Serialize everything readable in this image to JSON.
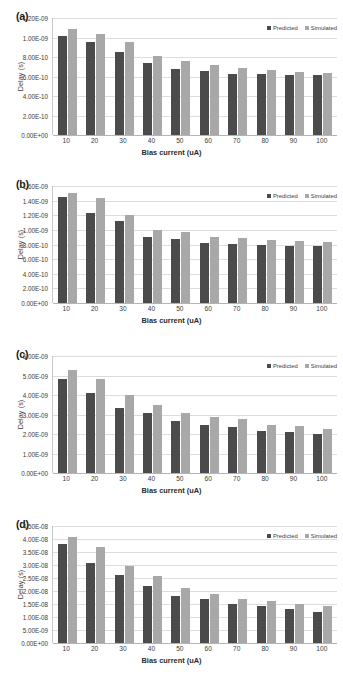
{
  "figure": {
    "panels": [
      {
        "label": "(a)",
        "legend": {
          "predicted": "Predicted",
          "simulated": "Simulated"
        },
        "chart_data": {
          "type": "bar",
          "title": "",
          "xlabel": "Bias current (uA)",
          "ylabel": "Delay (s)",
          "categories": [
            "10",
            "20",
            "30",
            "40",
            "50",
            "60",
            "70",
            "80",
            "90",
            "100"
          ],
          "yticklabels": [
            "0.00E+00",
            "2.00E-10",
            "4.00E-10",
            "6.00E-10",
            "8.00E-10",
            "1.00E-09",
            "1.20E-09"
          ],
          "ylim": [
            0,
            1.2e-09
          ],
          "ytickstep": 2e-10,
          "grid": true,
          "legend_position": "top-right",
          "series": [
            {
              "name": "Predicted",
              "color": "#4b4b4b",
              "values": [
                1.02e-09,
                9.55e-10,
                8.55e-10,
                7.35e-10,
                6.75e-10,
                6.55e-10,
                6.3e-10,
                6.25e-10,
                6.2e-10,
                6.2e-10
              ]
            },
            {
              "name": "Simulated",
              "color": "#a8a8a8",
              "values": [
                1.09e-09,
                1.035e-09,
                9.55e-10,
                8.1e-10,
                7.55e-10,
                7.15e-10,
                6.85e-10,
                6.65e-10,
                6.45e-10,
                6.4e-10
              ]
            }
          ]
        }
      },
      {
        "label": "(b)",
        "legend": {
          "predicted": "Predicted",
          "simulated": "Simulated"
        },
        "chart_data": {
          "type": "bar",
          "title": "",
          "xlabel": "Bias current (uA)",
          "ylabel": "Delay (s)",
          "categories": [
            "10",
            "20",
            "30",
            "40",
            "50",
            "60",
            "70",
            "80",
            "90",
            "100"
          ],
          "yticklabels": [
            "0.00E+00",
            "2.00E-10",
            "4.00E-10",
            "6.00E-10",
            "8.00E-10",
            "1.00E-09",
            "1.20E-09",
            "1.40E-09",
            "1.60E-09"
          ],
          "ylim": [
            0,
            1.6e-09
          ],
          "ytickstep": 2e-10,
          "grid": true,
          "legend_position": "top-right",
          "series": [
            {
              "name": "Predicted",
              "color": "#4b4b4b",
              "values": [
                1.455e-09,
                1.235e-09,
                1.115e-09,
                9e-10,
                8.8e-10,
                8.2e-10,
                8.1e-10,
                7.95e-10,
                7.85e-10,
                7.75e-10
              ]
            },
            {
              "name": "Simulated",
              "color": "#a8a8a8",
              "values": [
                1.51e-09,
                1.435e-09,
                1.205e-09,
                1.005e-09,
                9.75e-10,
                9.05e-10,
                8.9e-10,
                8.55e-10,
                8.45e-10,
                8.3e-10
              ]
            }
          ]
        }
      },
      {
        "label": "(c)",
        "legend": {
          "predicted": "Predicted",
          "simulated": "Simulated"
        },
        "chart_data": {
          "type": "bar",
          "title": "",
          "xlabel": "Bias current (uA)",
          "ylabel": "Delay (s)",
          "categories": [
            "10",
            "20",
            "30",
            "40",
            "50",
            "60",
            "70",
            "80",
            "90",
            "100"
          ],
          "yticklabels": [
            "0.00E+00",
            "1.00E-09",
            "2.00E-09",
            "3.00E-09",
            "4.00E-09",
            "5.00E-09",
            "6.00E-09"
          ],
          "ylim": [
            0,
            6e-09
          ],
          "ytickstep": 1e-09,
          "grid": true,
          "legend_position": "top-right",
          "series": [
            {
              "name": "Predicted",
              "color": "#4b4b4b",
              "values": [
                4.8e-09,
                4.1e-09,
                3.35e-09,
                3.08e-09,
                2.68e-09,
                2.48e-09,
                2.35e-09,
                2.18e-09,
                2.08e-09,
                1.98e-09
              ]
            },
            {
              "name": "Simulated",
              "color": "#a8a8a8",
              "values": [
                5.28e-09,
                4.8e-09,
                3.98e-09,
                3.47e-09,
                3.08e-09,
                2.88e-09,
                2.78e-09,
                2.48e-09,
                2.4e-09,
                2.25e-09
              ]
            }
          ]
        }
      },
      {
        "label": "(d)",
        "legend": {
          "predicted": "Predicted",
          "simulated": "Simulated"
        },
        "chart_data": {
          "type": "bar",
          "title": "",
          "xlabel": "Bias current (uA)",
          "ylabel": "Delay (s)",
          "categories": [
            "10",
            "20",
            "30",
            "40",
            "50",
            "60",
            "70",
            "80",
            "90",
            "100"
          ],
          "yticklabels": [
            "0.00E+00",
            "5.00E-09",
            "1.00E-08",
            "1.50E-08",
            "2.00E-08",
            "2.50E-08",
            "3.00E-08",
            "3.50E-08",
            "4.00E-08",
            "4.50E-08"
          ],
          "ylim": [
            0,
            4.5e-08
          ],
          "ytickstep": 5e-09,
          "grid": true,
          "legend_position": "top-right",
          "series": [
            {
              "name": "Predicted",
              "color": "#4b4b4b",
              "values": [
                3.8e-08,
                3.08e-08,
                2.62e-08,
                2.2e-08,
                1.8e-08,
                1.7e-08,
                1.5e-08,
                1.41e-08,
                1.31e-08,
                1.21e-08
              ]
            },
            {
              "name": "Simulated",
              "color": "#a8a8a8",
              "values": [
                4.08e-08,
                3.7e-08,
                2.98e-08,
                2.58e-08,
                2.1e-08,
                1.9e-08,
                1.7e-08,
                1.6e-08,
                1.5e-08,
                1.41e-08
              ]
            }
          ]
        }
      }
    ]
  }
}
